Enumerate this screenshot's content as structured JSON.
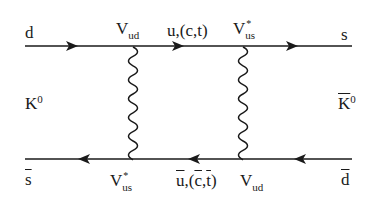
{
  "diagram": {
    "type": "feynman-box-diagram",
    "colors": {
      "line": "#1a1a1a",
      "background": "#ffffff"
    },
    "external": {
      "top_left": "d",
      "top_right": "s",
      "bottom_left": "s",
      "bottom_right": "d",
      "left_meson": {
        "base": "K",
        "sup": "0"
      },
      "right_meson": {
        "base": "K",
        "sup": "0"
      }
    },
    "vertices": {
      "top_left": {
        "base": "V",
        "sub": "ud",
        "sup": ""
      },
      "top_right": {
        "base": "V",
        "sub": "us",
        "sup": "*"
      },
      "bottom_left": {
        "base": "V",
        "sub": "us",
        "sup": "*"
      },
      "bottom_right": {
        "base": "V",
        "sub": "ud",
        "sup": ""
      }
    },
    "internal": {
      "top": "u,(c,t)",
      "bottom_u": "u",
      "bottom_sep": ",(",
      "bottom_c": "c",
      "bottom_comma": ",",
      "bottom_t": "t",
      "bottom_close": ")"
    },
    "edges": [
      {
        "from": "d",
        "to": "V_ud",
        "kind": "fermion",
        "arrow": "right"
      },
      {
        "from": "V_ud",
        "to": "V_us*",
        "kind": "fermion",
        "label": "u,(c,t)",
        "arrow": "right"
      },
      {
        "from": "V_us*",
        "to": "s",
        "kind": "fermion",
        "arrow": "right"
      },
      {
        "from": "d-bar",
        "to": "V_ud",
        "kind": "antifermion",
        "arrow": "left"
      },
      {
        "from": "V_ud",
        "to": "V_us*",
        "kind": "antifermion",
        "label": "u-bar,(c-bar,t-bar)",
        "arrow": "left"
      },
      {
        "from": "V_us*",
        "to": "s-bar",
        "kind": "antifermion",
        "arrow": "left"
      },
      {
        "from": "top-left-vertex",
        "to": "bottom-left-vertex",
        "kind": "W-boson (wavy)"
      },
      {
        "from": "top-right-vertex",
        "to": "bottom-right-vertex",
        "kind": "W-boson (wavy)"
      }
    ]
  }
}
